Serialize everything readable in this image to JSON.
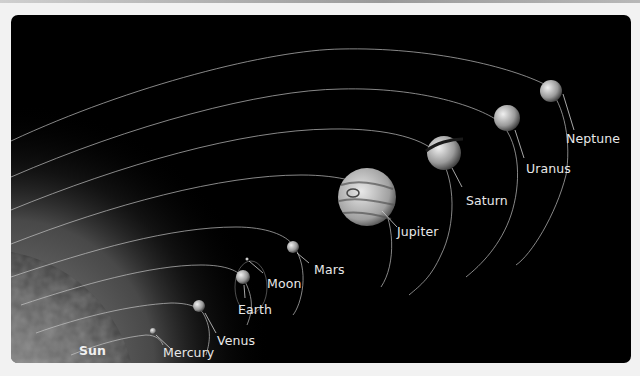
{
  "diagram": {
    "background_color": "#000000",
    "orbit_color": "#c8c8c8",
    "label_color": "#e8e8e8",
    "bodies": [
      {
        "name": "Sun",
        "kind": "star"
      },
      {
        "name": "Mercury",
        "kind": "planet"
      },
      {
        "name": "Venus",
        "kind": "planet"
      },
      {
        "name": "Earth",
        "kind": "planet"
      },
      {
        "name": "Moon",
        "kind": "moon"
      },
      {
        "name": "Mars",
        "kind": "planet"
      },
      {
        "name": "Jupiter",
        "kind": "planet"
      },
      {
        "name": "Saturn",
        "kind": "planet"
      },
      {
        "name": "Uranus",
        "kind": "planet"
      },
      {
        "name": "Neptune",
        "kind": "planet"
      }
    ]
  }
}
